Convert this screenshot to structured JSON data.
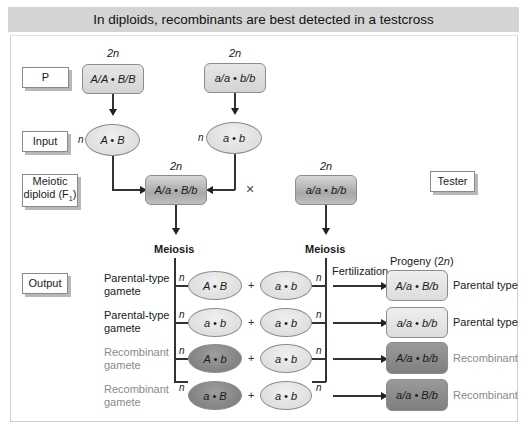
{
  "header": {
    "title": "In diploids, recombinants are best detected in a testcross"
  },
  "row_labels": {
    "p": "P",
    "input": "Input",
    "meiotic_diploid": "Meiotic diploid (F₁)",
    "output": "Output",
    "tester": "Tester"
  },
  "ploidy": {
    "diploid": "2n",
    "haploid": "n"
  },
  "parents": {
    "left": {
      "genotype": "A/A • B/B"
    },
    "right": {
      "genotype": "a/a • b/b"
    }
  },
  "inputs": {
    "left": {
      "gamete": "A • B"
    },
    "right": {
      "gamete": "a • b"
    }
  },
  "f1": {
    "genotype": "A/a • B/b"
  },
  "cross_symbol": "×",
  "tester": {
    "genotype": "a/a • b/b"
  },
  "meiosis": {
    "left": "Meiosis",
    "right": "Meiosis"
  },
  "fertilization": "Fertilization",
  "progeny_header": "Progeny (2n)",
  "plus": "+",
  "gamete_rows": [
    {
      "type_label": "Parental-type gamete",
      "f1_gamete": "A • B",
      "tester_gamete": "a • b",
      "progeny": "A/a • B/b",
      "result": "Parental type",
      "recombinant": false
    },
    {
      "type_label": "Parental-type gamete",
      "f1_gamete": "a • b",
      "tester_gamete": "a • b",
      "progeny": "a/a • b/b",
      "result": "Parental type",
      "recombinant": false
    },
    {
      "type_label": "Recombinant gamete",
      "f1_gamete": "A • b",
      "tester_gamete": "a • b",
      "progeny": "A/a • b/b",
      "result": "Recombinant",
      "recombinant": true
    },
    {
      "type_label": "Recombinant gamete",
      "f1_gamete": "a • B",
      "tester_gamete": "a • b",
      "progeny": "a/a • B/b",
      "result": "Recombinant",
      "recombinant": true
    }
  ],
  "colors": {
    "header_bg": "#d4d4d4",
    "recombinant_text": "#8a8a8a",
    "recombinant_fill": "#888888",
    "parental_fill": "#e0e0e0"
  }
}
